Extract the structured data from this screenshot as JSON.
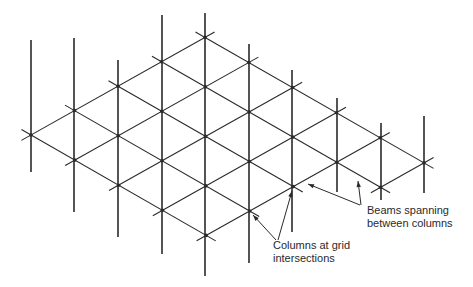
{
  "diagram": {
    "title": "",
    "line_color": "#2a2a2a",
    "lattice": {
      "origin": [
        31,
        135
      ],
      "vec_up_right": [
        43.5,
        -24.4
      ],
      "vec_down_right": [
        43.8,
        25.1
      ],
      "nodes": [
        [
          0,
          0
        ],
        [
          0,
          1
        ],
        [
          0,
          2
        ],
        [
          0,
          3
        ],
        [
          0,
          4
        ],
        [
          1,
          0
        ],
        [
          1,
          1
        ],
        [
          1,
          2
        ],
        [
          1,
          3
        ],
        [
          1,
          4
        ],
        [
          2,
          0
        ],
        [
          2,
          1
        ],
        [
          2,
          2
        ],
        [
          2,
          3
        ],
        [
          2,
          4
        ],
        [
          3,
          0
        ],
        [
          3,
          1
        ],
        [
          3,
          2
        ],
        [
          3,
          3
        ],
        [
          3,
          4
        ],
        [
          3,
          5
        ],
        [
          4,
          0
        ],
        [
          4,
          1
        ],
        [
          4,
          2
        ],
        [
          4,
          3
        ],
        [
          4,
          4
        ],
        [
          4,
          5
        ]
      ],
      "beam_overhang": 11
    },
    "columns": [
      {
        "x": 31,
        "top": 40,
        "bottom": 172
      },
      {
        "x": 74,
        "top": 38,
        "bottom": 212
      },
      {
        "x": 118,
        "top": 60,
        "bottom": 237
      },
      {
        "x": 162,
        "top": 15,
        "bottom": 254
      },
      {
        "x": 205,
        "top": 13,
        "bottom": 276
      },
      {
        "x": 249,
        "top": 44,
        "bottom": 263
      },
      {
        "x": 292,
        "top": 70,
        "bottom": 232
      },
      {
        "x": 337,
        "top": 98,
        "bottom": 192
      },
      {
        "x": 381,
        "top": 123,
        "bottom": 200
      },
      {
        "x": 424,
        "top": 116,
        "bottom": 193
      }
    ],
    "annotations": [
      {
        "id": "beams",
        "lines": [
          "Beams spanning",
          "between columns"
        ],
        "x": 367,
        "y": 204,
        "arrows": [
          {
            "from": [
              360,
              205
            ],
            "to": [
              308,
              184
            ]
          },
          {
            "from": [
              361,
              205
            ],
            "to": [
              358,
              181
            ]
          }
        ]
      },
      {
        "id": "columns",
        "lines": [
          "Columns at grid",
          "intersections"
        ],
        "x": 273,
        "y": 239,
        "arrows": [
          {
            "from": [
              276,
              240
            ],
            "to": [
              253,
              215
            ]
          },
          {
            "from": [
              278,
              240
            ],
            "to": [
              292,
              191
            ]
          }
        ]
      }
    ]
  }
}
